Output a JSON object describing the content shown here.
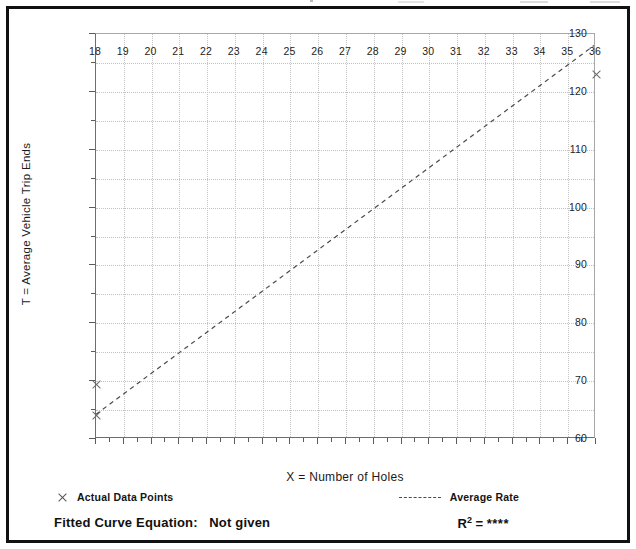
{
  "chart_data": {
    "type": "scatter",
    "title": "",
    "xlabel": "X = Number of Holes",
    "ylabel": "T = Average Vehicle Trip Ends",
    "xlim": [
      18,
      36
    ],
    "ylim": [
      60,
      130
    ],
    "xticks": [
      18,
      19,
      20,
      21,
      22,
      23,
      24,
      25,
      26,
      27,
      28,
      29,
      30,
      31,
      32,
      33,
      34,
      35,
      36
    ],
    "xticklabels": [
      "18",
      "19",
      "20",
      "21",
      "22",
      "23",
      "24",
      "25",
      "26",
      "27",
      "28",
      "29",
      "30",
      "31",
      "32",
      "33",
      "34",
      "35",
      "36"
    ],
    "yticks": [
      60,
      70,
      80,
      90,
      100,
      110,
      120,
      130
    ],
    "yticklabels": [
      "60",
      "70",
      "80",
      "90",
      "100",
      "110",
      "120",
      "130"
    ],
    "yminorticks": [
      65,
      75,
      85,
      95,
      105,
      115,
      125
    ],
    "grid": true,
    "grid_style": "dotted",
    "legend_position": "below-axes",
    "series": [
      {
        "name": "Actual Data Points",
        "type": "scatter",
        "marker": "x",
        "color": "#6b6b6b",
        "points": [
          {
            "x": 18,
            "y": 69.5
          },
          {
            "x": 18,
            "y": 64.0
          },
          {
            "x": 36,
            "y": 123.0
          }
        ]
      },
      {
        "name": "Average Rate",
        "type": "line",
        "linestyle": "dashed",
        "color": "#4a4a4a",
        "points": [
          {
            "x": 18,
            "y": 64.0
          },
          {
            "x": 36,
            "y": 128.0
          }
        ]
      }
    ]
  },
  "legend": {
    "data_points_label": "Actual Data Points",
    "average_rate_label": "Average Rate",
    "data_points_marker": "x-marker-icon",
    "average_rate_marker": "dashed-line-icon"
  },
  "footer": {
    "fitted_curve_label": "Fitted Curve Equation:",
    "fitted_curve_value": "Not given",
    "r_squared_symbol": "R",
    "r_squared_exponent": "2",
    "r_squared_equals": "=",
    "r_squared_value": "****"
  },
  "colors": {
    "frame": "#111111",
    "grid": "#c2c2c2",
    "axis": "#5b5b5b",
    "marker": "#6b6b6b",
    "trend": "#4a4a4a",
    "text": "#111111",
    "background": "#ffffff"
  }
}
